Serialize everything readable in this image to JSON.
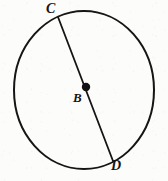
{
  "figure": {
    "kind": "circle-with-diameter",
    "background_color": "#fcfcfb",
    "stroke_color": "#151515",
    "circle": {
      "center_x": 84,
      "center_y": 90,
      "radius_x": 70,
      "radius_y": 79,
      "stroke_width": 2.0
    },
    "center_point": {
      "name": "center-dot",
      "x": 86,
      "y": 87,
      "radius": 4.2,
      "fill": "#121212"
    },
    "diameter": {
      "name": "diameter-CD",
      "x1": 58,
      "y1": 17,
      "x2": 113,
      "y2": 161,
      "stroke_width": 1.8
    },
    "labels": [
      {
        "id": "C",
        "text": "C",
        "x": 46,
        "y": 2,
        "font_size": 14
      },
      {
        "id": "B",
        "text": "B",
        "x": 73,
        "y": 91,
        "font_size": 13
      },
      {
        "id": "D",
        "text": "D",
        "x": 111,
        "y": 159,
        "font_size": 14
      }
    ]
  }
}
